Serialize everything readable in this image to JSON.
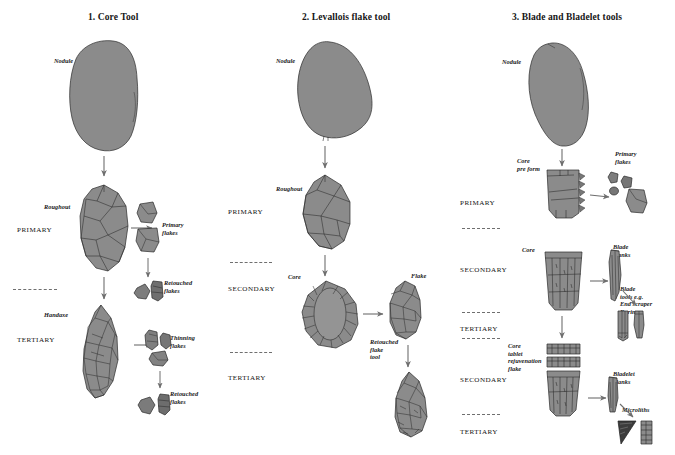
{
  "figure": {
    "background_color": "#ffffff",
    "stone_fill": "#8b8b8b",
    "stone_stroke": "#2b2b2b",
    "arrow_color": "#707070",
    "dash_color": "#6f6f6f"
  },
  "columns": [
    {
      "id": "core-tool",
      "title": "1. Core Tool",
      "stages": [
        "PRIMARY",
        "TERTIARY"
      ],
      "labels": {
        "nodule": "Nodule",
        "roughout": "Roughout",
        "primary_flakes": "Primary\nflakes",
        "retouched_flakes_1": "Retouched\nflakes",
        "handaxe": "Handaxe",
        "thinning_flakes": "Thinning\nflakes",
        "retouched_flakes_2": "Retouched\nflakes"
      }
    },
    {
      "id": "levallois-flake-tool",
      "title": "2. Levallois flake tool",
      "stages": [
        "PRIMARY",
        "SECONDARY",
        "TERTIARY"
      ],
      "labels": {
        "nodule": "Nodule",
        "roughout": "Roughout",
        "core": "Core",
        "flake": "Flake",
        "retouched_flake_tool": "Retouched\nflake\ntool"
      }
    },
    {
      "id": "blade-and-bladelet-tools",
      "title": "3. Blade and Bladelet tools",
      "stages": [
        "PRIMARY",
        "SECONDARY",
        "TERTIARY",
        "SECONDARY",
        "TERTIARY"
      ],
      "labels": {
        "nodule": "Nodule",
        "core_pre_form": "Core\npre form",
        "primary_flakes": "Primary\nflakes",
        "core": "Core",
        "blade_blanks": "Blade\nblanks",
        "blade_tools": "Blade\ntools e.g.\nEnd scraper\nBurin",
        "core_tablet": "Core\ntablet\nrejuvenation\nflake",
        "bladelet_blanks": "Bladelet\nblanks",
        "microliths": "Microliths"
      }
    }
  ]
}
